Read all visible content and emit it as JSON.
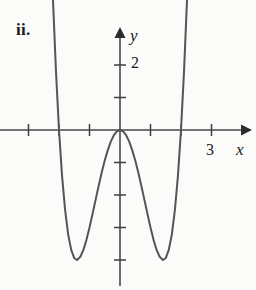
{
  "figure": {
    "part_label": "ii.",
    "background_color": "#fbfbf9",
    "curve_color": "#555555",
    "axis_color": "#4a4a4a",
    "text_color": "#1a1a1a"
  },
  "axes": {
    "x_axis_label": "x",
    "y_axis_label": "y",
    "x_tick_labels": [
      {
        "value": 3,
        "text": "3"
      }
    ],
    "y_tick_labels": [
      {
        "value": 2,
        "text": "2"
      }
    ],
    "origin_px": {
      "x": 120,
      "y": 130
    },
    "unit_px": {
      "x": 30.5,
      "y": 32.5
    },
    "x_ticks": [
      -3,
      -2,
      -1,
      1,
      2,
      3
    ],
    "y_ticks": [
      1,
      2,
      -1,
      -2,
      -3,
      -4,
      -5
    ],
    "x_range": [
      -3.9,
      4.2
    ],
    "y_range": [
      -4.8,
      3.1
    ],
    "arrows": [
      "x-positive",
      "y-positive"
    ],
    "grid": false
  },
  "chart_data": {
    "type": "line",
    "title": "",
    "subtitle": "",
    "xlabel": "x",
    "ylabel": "y",
    "xlim": [
      -3.9,
      4.2
    ],
    "ylim": [
      -4.8,
      3.1
    ],
    "grid": false,
    "legend": "none",
    "annotations": [
      {
        "text": "ii.",
        "role": "part-label"
      }
    ],
    "series": [
      {
        "name": "quartic",
        "expression": "y = x^4 - 4x^2",
        "roots": [
          -2,
          0,
          2
        ],
        "local_maximum": {
          "x": 0,
          "y": 0
        },
        "local_minima": [
          {
            "x": -1.41,
            "y": -4
          },
          {
            "x": 1.41,
            "y": -4
          }
        ],
        "x": [
          -2.3,
          -2.2,
          -2.1,
          -2.0,
          -1.9,
          -1.8,
          -1.7,
          -1.6,
          -1.5,
          -1.41,
          -1.3,
          -1.2,
          -1.1,
          -1.0,
          -0.9,
          -0.8,
          -0.7,
          -0.6,
          -0.5,
          -0.4,
          -0.3,
          -0.2,
          -0.1,
          0.0,
          0.1,
          0.2,
          0.3,
          0.4,
          0.5,
          0.6,
          0.7,
          0.8,
          0.9,
          1.0,
          1.1,
          1.2,
          1.3,
          1.41,
          1.5,
          1.6,
          1.7,
          1.8,
          1.9,
          2.0,
          2.1,
          2.2,
          2.3
        ],
        "y": [
          6.82,
          4.07,
          1.82,
          0.0,
          -1.41,
          -2.46,
          -3.21,
          -3.69,
          -3.94,
          -4.0,
          -3.9,
          -3.69,
          -3.38,
          -3.0,
          -2.58,
          -2.15,
          -1.72,
          -1.31,
          -0.94,
          -0.62,
          -0.35,
          -0.16,
          -0.04,
          0.0,
          -0.04,
          -0.16,
          -0.35,
          -0.62,
          -0.94,
          -1.31,
          -1.72,
          -2.15,
          -2.58,
          -3.0,
          -3.38,
          -3.69,
          -3.9,
          -4.0,
          -3.94,
          -3.69,
          -3.21,
          -2.46,
          -1.41,
          0.0,
          1.82,
          4.07,
          6.82
        ]
      }
    ]
  }
}
